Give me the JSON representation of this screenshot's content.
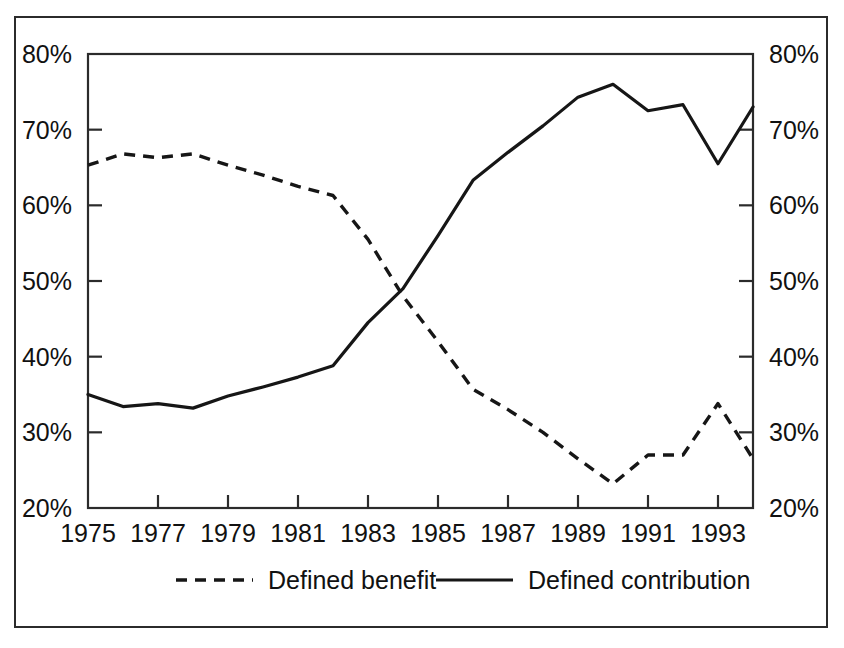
{
  "figure": {
    "background_color": "#ffffff",
    "ink_color": "#161616",
    "frame_color": "#2b2b2b",
    "has_outer_border": true
  },
  "chart_data": {
    "type": "line",
    "title": "",
    "subtitle": "",
    "xlabel": "",
    "ylabel": "",
    "x": [
      1975,
      1976,
      1977,
      1978,
      1979,
      1980,
      1981,
      1982,
      1983,
      1984,
      1985,
      1986,
      1987,
      1988,
      1989,
      1990,
      1991,
      1992,
      1993,
      1994
    ],
    "xlim": [
      1975,
      1994
    ],
    "ylim": [
      20,
      80
    ],
    "y_tick_values": [
      20,
      30,
      40,
      50,
      60,
      70,
      80
    ],
    "y_tick_labels": [
      "20%",
      "30%",
      "40%",
      "50%",
      "60%",
      "70%",
      "80%"
    ],
    "y_axis_right_tick_labels": [
      "20%",
      "30%",
      "40%",
      "50%",
      "60%",
      "70%",
      "80%"
    ],
    "x_tick_values": [
      1975,
      1977,
      1979,
      1981,
      1983,
      1985,
      1987,
      1989,
      1991,
      1993
    ],
    "x_tick_labels": [
      "1975",
      "1977",
      "1979",
      "1981",
      "1983",
      "1985",
      "1987",
      "1989",
      "1991",
      "1993"
    ],
    "x_minor_tick_values": [
      1975,
      1977,
      1979,
      1981,
      1983,
      1985,
      1987,
      1989,
      1991,
      1993
    ],
    "grid": false,
    "legend_position": "bottom",
    "dual_y_axis": true,
    "units": "percent",
    "series": [
      {
        "name": "Defined benefit",
        "style": "dashed",
        "values": [
          65.3,
          66.8,
          66.3,
          66.8,
          65.3,
          64.0,
          62.5,
          61.3,
          55.5,
          48.0,
          42.0,
          35.7,
          33.0,
          30.0,
          26.5,
          23.2,
          27.0,
          27.0,
          33.8,
          26.5
        ]
      },
      {
        "name": "Defined contribution",
        "style": "solid",
        "values": [
          35.0,
          33.4,
          33.8,
          33.2,
          34.8,
          36.0,
          37.3,
          38.8,
          44.5,
          49.0,
          56.0,
          63.3,
          67.0,
          70.5,
          74.3,
          76.0,
          72.5,
          73.3,
          65.5,
          73.0
        ]
      }
    ]
  },
  "legend": {
    "items": [
      {
        "label": "Defined benefit",
        "style": "dashed"
      },
      {
        "label": "Defined contribution",
        "style": "solid"
      }
    ]
  }
}
